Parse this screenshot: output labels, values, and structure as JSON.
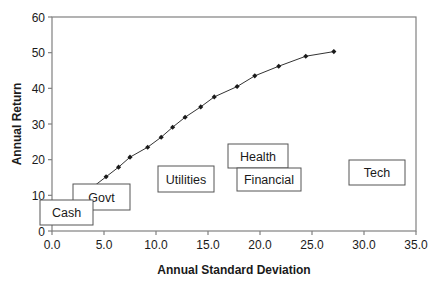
{
  "chart_data": {
    "type": "scatter",
    "title": "",
    "xlabel": "Annual Standard Deviation",
    "ylabel": "Annual Return",
    "xlim": [
      0,
      35
    ],
    "ylim": [
      0,
      60
    ],
    "x_ticks": [
      "0.0",
      "5.0",
      "10.0",
      "15.0",
      "20.0",
      "25.0",
      "30.0",
      "35.0"
    ],
    "y_ticks": [
      "0",
      "10",
      "20",
      "30",
      "40",
      "50",
      "60"
    ],
    "grid": false,
    "legend": "none",
    "series": [
      {
        "name": "Efficient Frontier",
        "style": "line-with-markers",
        "x": [
          4.0,
          5.2,
          6.4,
          7.5,
          9.2,
          10.5,
          11.6,
          12.8,
          14.3,
          15.6,
          17.8,
          19.5,
          21.8,
          24.4,
          27.1
        ],
        "y": [
          12.5,
          15.2,
          17.9,
          20.7,
          23.5,
          26.3,
          29.1,
          31.9,
          34.8,
          37.6,
          40.5,
          43.5,
          46.2,
          49.0,
          50.3
        ]
      }
    ],
    "annotations": [
      {
        "label": "Cash",
        "x": 2.5,
        "y": 5
      },
      {
        "label": "Govt",
        "x": 5.0,
        "y": 10
      },
      {
        "label": "Utilities",
        "x": 12.5,
        "y": 14.5
      },
      {
        "label": "Health",
        "x": 19.5,
        "y": 21
      },
      {
        "label": "Financial",
        "x": 20.5,
        "y": 14.5
      },
      {
        "label": "Tech",
        "x": 30.5,
        "y": 16
      }
    ]
  },
  "colors": {
    "axis": "#808080",
    "line": "#333333",
    "marker": "#1a1a1a",
    "box_border": "#555555",
    "text": "#1a1a1a"
  }
}
